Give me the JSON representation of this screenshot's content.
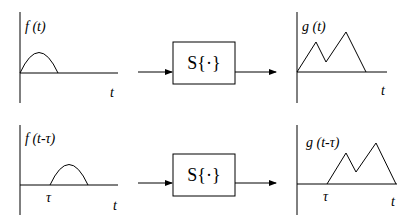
{
  "diagram": {
    "rows": [
      {
        "input_label": "f (t)",
        "input_axis_label": "t",
        "system_label": "S{·}",
        "output_label": "g (t)",
        "output_axis_label": "t",
        "shift_label": ""
      },
      {
        "input_label": "f (t-τ)",
        "input_axis_label": "t",
        "input_shift_label": "τ",
        "system_label": "S{·}",
        "output_label": "g (t-τ)",
        "output_axis_label": "t",
        "output_shift_label": "τ"
      }
    ]
  }
}
